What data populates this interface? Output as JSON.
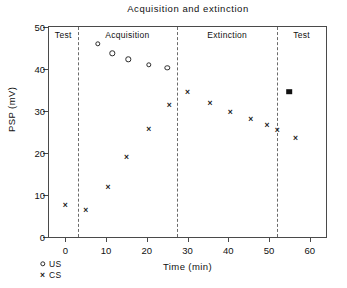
{
  "chart_data": {
    "type": "scatter",
    "title": "Acquisition and extinction",
    "xlabel": "Time (min)",
    "ylabel": "PSP (mV)",
    "xlim": [
      -4,
      64
    ],
    "ylim": [
      0,
      50
    ],
    "xticks": [
      0,
      10,
      20,
      30,
      40,
      50,
      60
    ],
    "xtick_labels": [
      "0",
      "10",
      "20",
      "30",
      "40",
      "50",
      "60"
    ],
    "yticks": [
      0,
      10,
      20,
      30,
      40,
      50
    ],
    "ytick_labels": [
      "0",
      "10",
      "20",
      "30",
      "40",
      "50"
    ],
    "grid": false,
    "legend_position": "below-axis-left",
    "series": [
      {
        "name": "US",
        "marker": "open-circle",
        "points": [
          {
            "x": 8.0,
            "y": 46.0
          },
          {
            "x": 11.5,
            "y": 43.7
          },
          {
            "x": 15.5,
            "y": 42.3
          },
          {
            "x": 20.5,
            "y": 41.0
          },
          {
            "x": 25.0,
            "y": 40.3
          }
        ]
      },
      {
        "name": "CS",
        "marker": "x",
        "points": [
          {
            "x": 0.0,
            "y": 7.6
          },
          {
            "x": 5.0,
            "y": 6.5
          },
          {
            "x": 10.5,
            "y": 12.0
          },
          {
            "x": 15.0,
            "y": 19.0
          },
          {
            "x": 20.5,
            "y": 25.7
          },
          {
            "x": 25.5,
            "y": 31.4
          },
          {
            "x": 30.0,
            "y": 34.6
          },
          {
            "x": 35.5,
            "y": 32.0
          },
          {
            "x": 40.5,
            "y": 29.7
          },
          {
            "x": 45.5,
            "y": 28.0
          },
          {
            "x": 49.5,
            "y": 26.6
          },
          {
            "x": 52.0,
            "y": 25.5
          },
          {
            "x": 56.5,
            "y": 23.6
          }
        ]
      },
      {
        "name": "Test filled",
        "marker": "filled-square",
        "points": [
          {
            "x": 55.0,
            "y": 34.6
          }
        ]
      }
    ],
    "phases": [
      {
        "label": "Test",
        "start": -4,
        "end": 3.0
      },
      {
        "label": "Acquisition",
        "start": 3.0,
        "end": 27.5
      },
      {
        "label": "Extinction",
        "start": 27.5,
        "end": 52.0
      },
      {
        "label": "Test",
        "start": 52.0,
        "end": 64
      }
    ],
    "phase_dividers": [
      3.0,
      27.5,
      52.0
    ],
    "annotations": [],
    "colors": {
      "axis": "#4a4a4a",
      "divider": "#6b6b6b",
      "marker": "#1a1a1a",
      "text": "#111111"
    }
  },
  "legend": {
    "entries": [
      {
        "label": "US",
        "icon": "open-circle-marker-icon"
      },
      {
        "label": "CS",
        "icon": "x-marker-icon"
      }
    ]
  }
}
